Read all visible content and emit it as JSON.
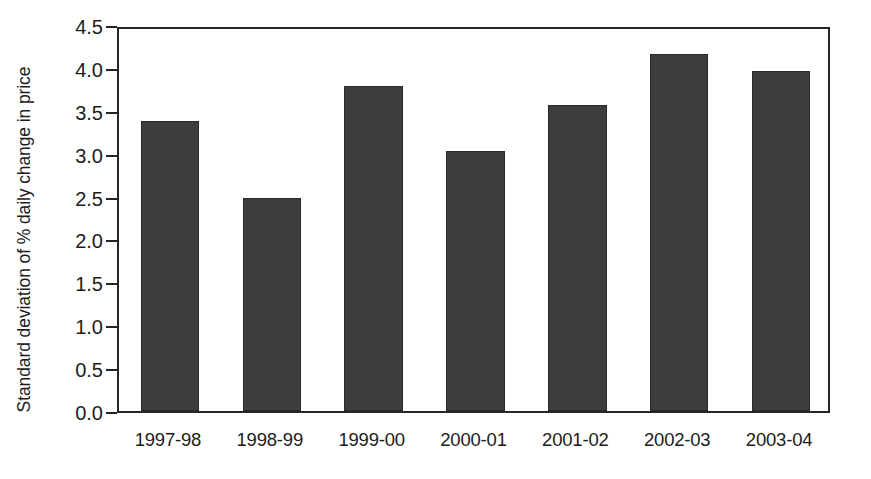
{
  "chart_data": {
    "type": "bar",
    "title": "",
    "subtitle": "",
    "xlabel": "",
    "ylabel": "Standard deviation of % daily change in price",
    "categories": [
      "1997-98",
      "1998-99",
      "1999-00",
      "2000-01",
      "2001-02",
      "2002-03",
      "2003-04"
    ],
    "values": [
      3.38,
      2.48,
      3.79,
      3.03,
      3.57,
      4.16,
      3.96
    ],
    "ylim": [
      0.0,
      4.5
    ],
    "ytick_values": [
      0.0,
      0.5,
      1.0,
      1.5,
      2.0,
      2.5,
      3.0,
      3.5,
      4.0,
      4.5
    ],
    "ytick_labels": [
      "0.0",
      "0.5",
      "1.0",
      "1.5",
      "2.0",
      "2.5",
      "3.0",
      "3.5",
      "4.0",
      "4.5"
    ],
    "grid": false,
    "legend": false,
    "legend_position": "none",
    "bar_color": "#3d3d3d",
    "axis_color": "#262626",
    "background_color": "#ffffff"
  }
}
